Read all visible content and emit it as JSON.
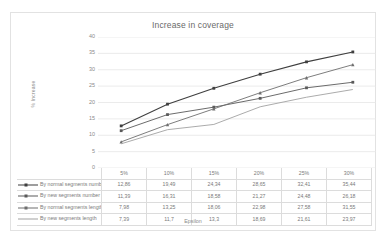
{
  "chart_data": {
    "type": "line",
    "title": "Increase in coverage",
    "xlabel": "Epsilon",
    "ylabel": "% Increase",
    "categories": [
      "5%",
      "10%",
      "15%",
      "20%",
      "25%",
      "30%"
    ],
    "ylim": [
      0,
      40
    ],
    "yticks": [
      "40",
      "35",
      "30",
      "25",
      "20",
      "15",
      "10",
      "5",
      "0"
    ],
    "grid": true,
    "legend_position": "data-table-left",
    "series": [
      {
        "name": "By normal segments number",
        "values": [
          12.86,
          19.49,
          24.34,
          28.65,
          32.41,
          35.44
        ],
        "labels": [
          "12,86",
          "19,49",
          "24,34",
          "28,65",
          "32,41",
          "35,44"
        ],
        "color": "#3f3f3f",
        "marker": "square"
      },
      {
        "name": "By new segments number",
        "values": [
          11.39,
          16.31,
          18.58,
          21.27,
          24.48,
          26.18
        ],
        "labels": [
          "11,39",
          "16,31",
          "18,58",
          "21,27",
          "24,48",
          "26,18"
        ],
        "color": "#5a5a5a",
        "marker": "square"
      },
      {
        "name": "By normal segments length",
        "values": [
          7.98,
          13.25,
          18.06,
          22.98,
          27.58,
          31.55
        ],
        "labels": [
          "7,98",
          "13,25",
          "18,06",
          "22,98",
          "27,58",
          "31,55"
        ],
        "color": "#6e6e6e",
        "marker": "triangle"
      },
      {
        "name": "By new segments length",
        "values": [
          7.39,
          11.7,
          13.3,
          18.69,
          21.61,
          23.97
        ],
        "labels": [
          "7,39",
          "11,7",
          "13,3",
          "18,69",
          "21,61",
          "23,97"
        ],
        "color": "#a2a2a2",
        "marker": "none"
      }
    ]
  },
  "table": {
    "corner": "",
    "headers": [
      "5%",
      "10%",
      "15%",
      "20%",
      "25%",
      "30%"
    ],
    "rows": [
      {
        "label": "By normal segments number",
        "cells": [
          "12,86",
          "19,49",
          "24,34",
          "28,65",
          "32,41",
          "35,44"
        ]
      },
      {
        "label": "By new segments number",
        "cells": [
          "11,39",
          "16,31",
          "18,58",
          "21,27",
          "24,48",
          "26,18"
        ]
      },
      {
        "label": "By normal segments length",
        "cells": [
          "7,98",
          "13,25",
          "18,06",
          "22,98",
          "27,58",
          "31,55"
        ]
      },
      {
        "label": "By new segments length",
        "cells": [
          "7,39",
          "11,7",
          "13,3",
          "18,69",
          "21,61",
          "23,97"
        ]
      }
    ]
  },
  "colors": {
    "gridline": "#e6e6e6",
    "frame": "#e2e2e2",
    "text": "#7a7a7a"
  }
}
